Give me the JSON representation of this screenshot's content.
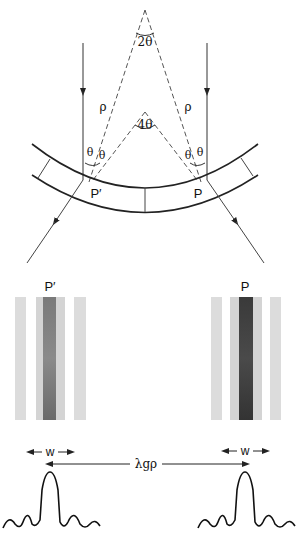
{
  "figure": {
    "labels": {
      "apex_angle": "2θ",
      "inner_angle": "4θ",
      "radius_left": "ρ",
      "radius_right": "ρ",
      "theta": "θ",
      "point_left": "P′",
      "point_right": "P",
      "stripe_label_left": "P′",
      "stripe_label_right": "P",
      "width_left": "w",
      "width_right": "w",
      "separation": "λgρ"
    },
    "colors": {
      "line": "#222222",
      "dashed": "#555555",
      "stripe_light": "#d9d9d9",
      "stripe_dark_left": "#6e6e6e",
      "stripe_dark_right": "#3c3c3c"
    }
  }
}
